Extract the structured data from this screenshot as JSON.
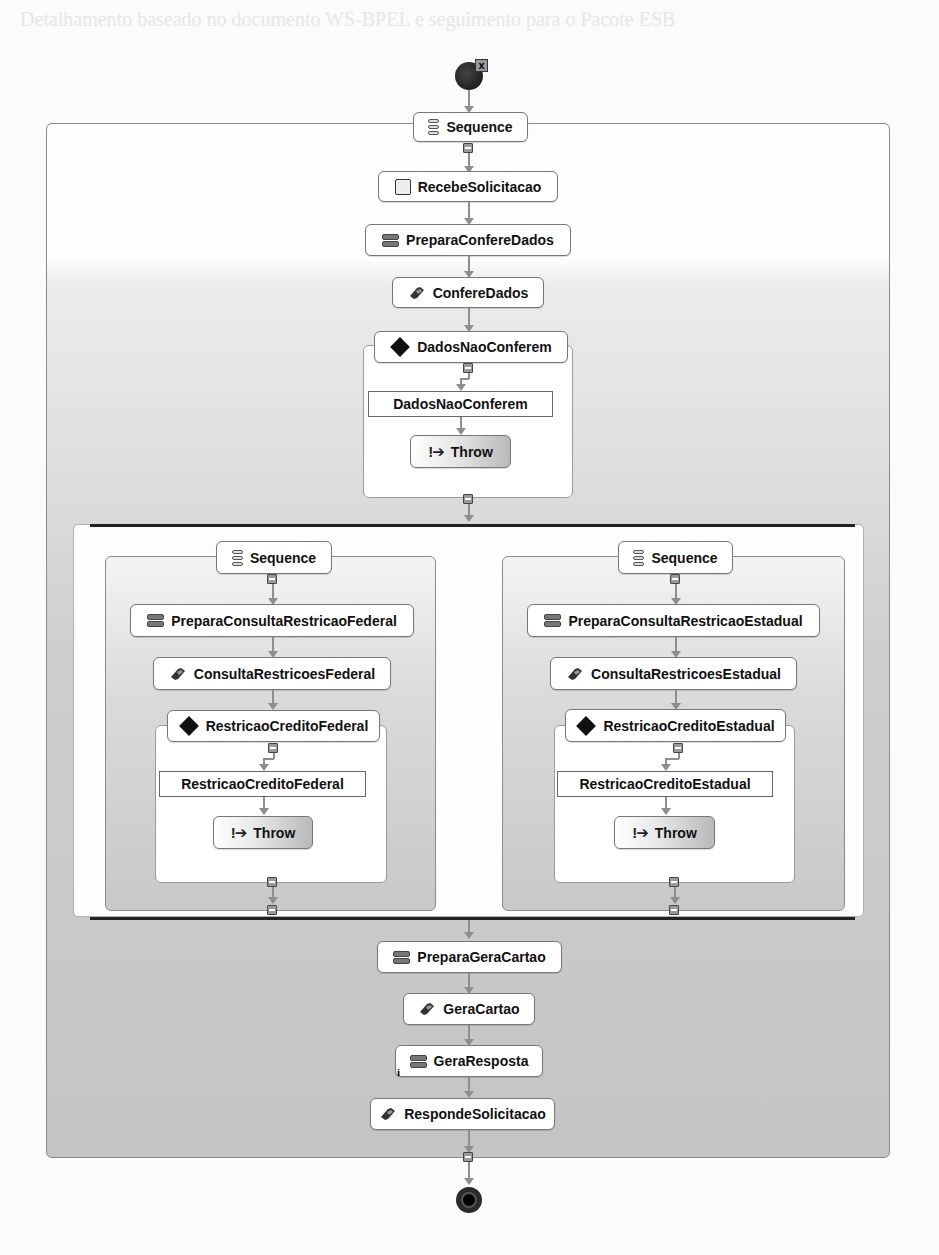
{
  "page": {
    "bleed_text": "Detalhamento baseado no documento WS-BPEL e seguimento para o Pacote ESB"
  },
  "workflow": {
    "start": {
      "type": "start",
      "error_badge": "x"
    },
    "root_sequence": {
      "label": "Sequence"
    },
    "steps": [
      {
        "label": "RecebeSolicitacao",
        "icon": "receive-icon"
      },
      {
        "label": "PreparaConfereDados",
        "icon": "assign-icon"
      },
      {
        "label": "ConfereDados",
        "icon": "invoke-icon"
      }
    ],
    "check_data": {
      "if_label": "DadosNaoConferem",
      "case_label": "DadosNaoConferem",
      "throw_label": "Throw",
      "throw_icon": "!➔"
    },
    "parallel": {
      "left": {
        "sequence_label": "Sequence",
        "prepare_label": "PreparaConsultaRestricaoFederal",
        "invoke_label": "ConsultaRestricoesFederal",
        "if_label": "RestricaoCreditoFederal",
        "case_label": "RestricaoCreditoFederal",
        "throw_label": "Throw"
      },
      "right": {
        "sequence_label": "Sequence",
        "prepare_label": "PreparaConsultaRestricaoEstadual",
        "invoke_label": "ConsultaRestricoesEstadual",
        "if_label": "RestricaoCreditoEstadual",
        "case_label": "RestricaoCreditoEstadual",
        "throw_label": "Throw"
      }
    },
    "final_steps": [
      {
        "label": "PreparaGeraCartao",
        "icon": "assign-icon"
      },
      {
        "label": "GeraCartao",
        "icon": "invoke-icon"
      },
      {
        "label": "GeraResposta",
        "icon": "assign-icon",
        "marker": "i"
      },
      {
        "label": "RespondeSolicitacao",
        "icon": "reply-icon"
      }
    ],
    "end": {
      "type": "end"
    }
  }
}
